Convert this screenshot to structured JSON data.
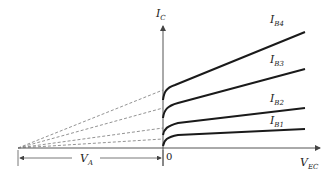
{
  "diagram": {
    "axes": {
      "y_label": {
        "main": "I",
        "sub": "C"
      },
      "x_label": {
        "main": "V",
        "sub": "EC"
      },
      "origin_label": "0"
    },
    "early_voltage": {
      "main": "V",
      "sub": "A"
    },
    "curves": [
      {
        "name": "I_B4",
        "label_main": "I",
        "label_sub": "B4"
      },
      {
        "name": "I_B3",
        "label_main": "I",
        "label_sub": "B3"
      },
      {
        "name": "I_B2",
        "label_main": "I",
        "label_sub": "B2"
      },
      {
        "name": "I_B1",
        "label_main": "I",
        "label_sub": "B1"
      }
    ],
    "colors": {
      "curve": "#1a1a1a",
      "axis": "#555555",
      "dashed": "#777777"
    }
  }
}
